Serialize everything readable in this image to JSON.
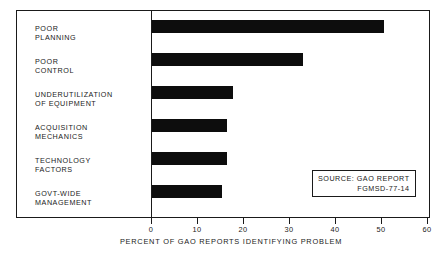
{
  "chart_data": {
    "type": "bar",
    "orientation": "horizontal",
    "title": "",
    "xlabel": "PERCENT OF GAO REPORTS IDENTIFYING PROBLEM",
    "ylabel": "",
    "xlim": [
      0,
      60
    ],
    "xticks": [
      "0",
      "10",
      "20",
      "30",
      "40",
      "50",
      "60"
    ],
    "grid": false,
    "legend": null,
    "categories": [
      "POOR\nPLANNING",
      "POOR\nCONTROL",
      "UNDERUTILIZATION\nOF EQUIPMENT",
      "ACQUISITION\nMECHANICS",
      "TECHNOLOGY\nFACTORS",
      "GOVT-WIDE\nMANAGEMENT"
    ],
    "values": [
      50.5,
      32.8,
      17.7,
      16.4,
      16.4,
      15.3
    ],
    "bar_color": "#0d0d0d"
  },
  "annotations": {
    "source_box": {
      "line1": "SOURCE:  GAO REPORT",
      "line2": "FGMSD-77-14"
    }
  }
}
